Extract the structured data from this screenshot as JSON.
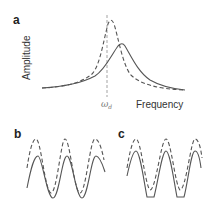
{
  "figure": {
    "panels": [
      {
        "label": "a",
        "ylabel": "Amplitude",
        "xlabel": "Frequency",
        "marker_label": "ω",
        "marker_subscript": "d",
        "series": [
          {
            "name": "dashed-response",
            "style": "dashed",
            "description": "sharper resonance peak near ω_d"
          },
          {
            "name": "solid-response",
            "style": "solid",
            "description": "broader, lower peak shifted to higher frequency"
          }
        ]
      },
      {
        "label": "b",
        "series": [
          {
            "name": "dashed-wave",
            "style": "dashed",
            "description": "larger amplitude sinusoid, phase-shifted"
          },
          {
            "name": "solid-wave",
            "style": "solid",
            "description": "sinusoid"
          }
        ]
      },
      {
        "label": "c",
        "series": [
          {
            "name": "dashed-wave",
            "style": "dashed",
            "description": "sinusoid"
          },
          {
            "name": "solid-wave",
            "style": "solid",
            "description": "sinusoid clipped at troughs"
          }
        ]
      }
    ],
    "colors": {
      "line": "#555555",
      "marker_line": "#999999",
      "text": "#222222"
    }
  }
}
